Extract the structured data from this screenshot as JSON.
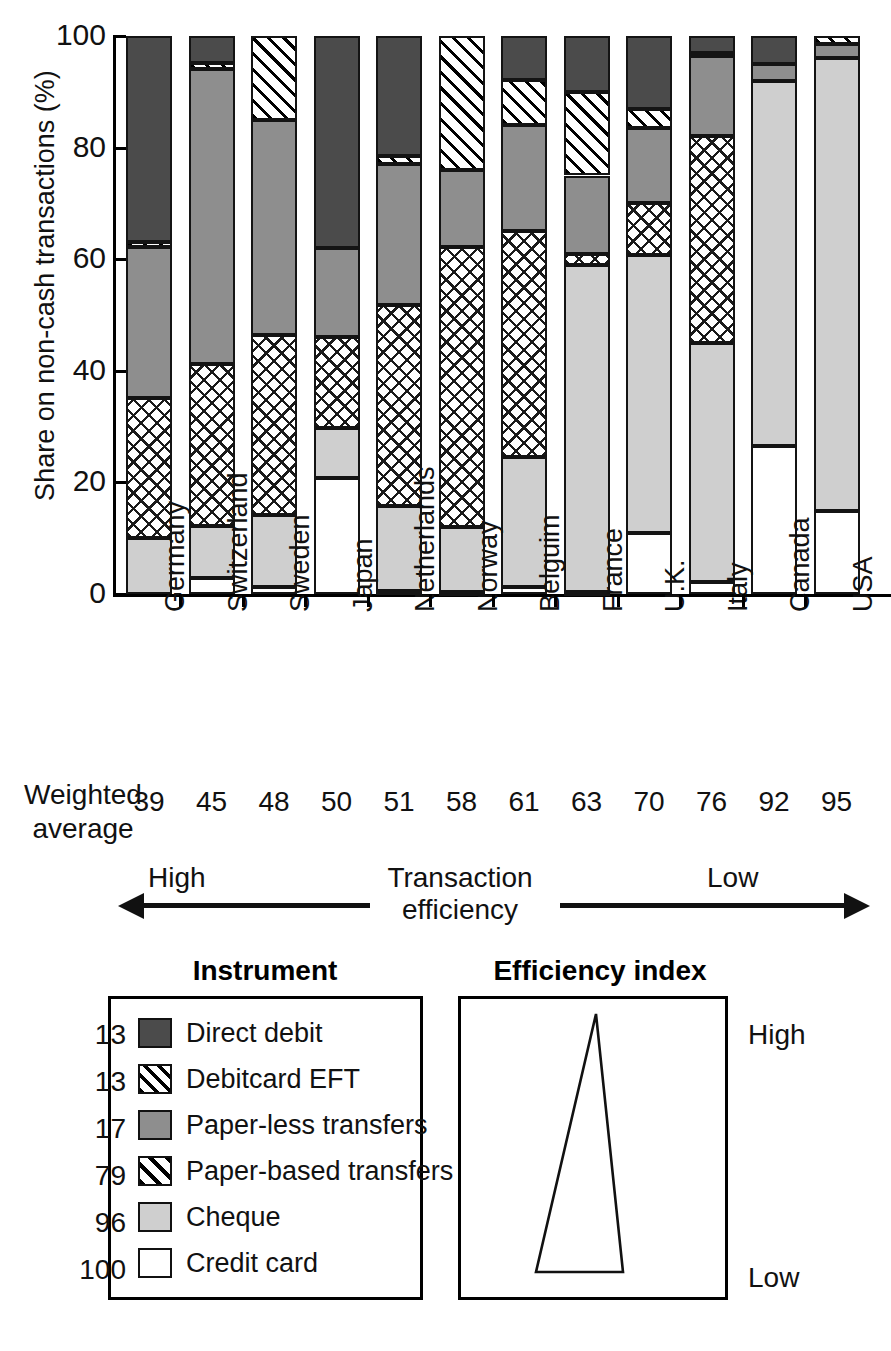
{
  "chart_data": {
    "type": "bar",
    "subtype": "stacked-100-percent",
    "title": "",
    "xlabel": "",
    "ylabel": "Share on non-cash transactions (%)",
    "ylim": [
      0,
      100
    ],
    "yticks": [
      0,
      20,
      40,
      60,
      80,
      100
    ],
    "grid": false,
    "legend_position": "below-left",
    "categories": [
      "Germany",
      "Switzerland",
      "Sweden",
      "Japan",
      "Netherlands",
      "Norway",
      "Belguim",
      "France",
      "U.K.",
      "Italy",
      "Canada",
      "USA"
    ],
    "series": [
      {
        "name": "Credit card",
        "key": "credit",
        "values": [
          0,
          2.8,
          1.2,
          20.8,
          0.5,
          0.3,
          1.2,
          0.4,
          11.0,
          2.2,
          26.5,
          14.8
        ]
      },
      {
        "name": "Cheque",
        "key": "cheque",
        "values": [
          10.0,
          12.2,
          14.2,
          29.8,
          15.8,
          12.0,
          24.5,
          59.0,
          60.8,
          45.0,
          92.0,
          96.0
        ]
      },
      {
        "name": "Paper-based transfers",
        "key": "paperbased",
        "values": [
          35.2,
          41.2,
          46.5,
          46.0,
          51.8,
          62.2,
          65.0,
          61.0,
          70.0,
          82.0,
          92.0,
          96.0
        ]
      },
      {
        "name": "Paper-less transfers",
        "key": "paperless",
        "values": [
          62.2,
          94.0,
          85.0,
          62.0,
          77.0,
          76.0,
          84.0,
          75.0,
          83.5,
          96.5,
          95.0,
          98.5
        ]
      },
      {
        "name": "Debitcard EFT",
        "key": "eft",
        "values": [
          63.0,
          95.2,
          100.0,
          62.0,
          78.5,
          100.0,
          92.2,
          90.0,
          87.0,
          97.0,
          95.0,
          100.0
        ]
      },
      {
        "name": "Direct debit",
        "key": "direct",
        "values": [
          100,
          100,
          100,
          100,
          100,
          100,
          100,
          100,
          100,
          100,
          100,
          100
        ]
      }
    ],
    "series_note": "values are cumulative upper edges (%) of each stacked segment, bottom to top",
    "weighted_average": {
      "label_line1": "Weighted",
      "label_line2": "average",
      "values": [
        39,
        45,
        48,
        50,
        51,
        58,
        61,
        63,
        70,
        76,
        92,
        95
      ]
    },
    "efficiency_axis": {
      "high_label": "High",
      "low_label": "Low",
      "center_line1": "Transaction",
      "center_line2": "efficiency"
    }
  },
  "legend": {
    "instrument_title": "Instrument",
    "items": [
      {
        "label": "Direct debit",
        "pattern": "f-direct",
        "color": "#4b4b4b"
      },
      {
        "label": "Debitcard EFT",
        "pattern": "f-eft",
        "color": "#ffffff"
      },
      {
        "label": "Paper-less transfers",
        "pattern": "f-paperless",
        "color": "#8e8e8e"
      },
      {
        "label": "Paper-based transfers",
        "pattern": "f-paperbased",
        "color": "#ffffff"
      },
      {
        "label": "Cheque",
        "pattern": "f-cheque",
        "color": "#cfcfcf"
      },
      {
        "label": "Credit card",
        "pattern": "f-credit",
        "color": "#ffffff"
      }
    ]
  },
  "efficiency_index": {
    "title": "Efficiency index",
    "values": [
      13,
      13,
      17,
      79,
      96,
      100
    ],
    "high_label": "High",
    "low_label": "Low"
  }
}
